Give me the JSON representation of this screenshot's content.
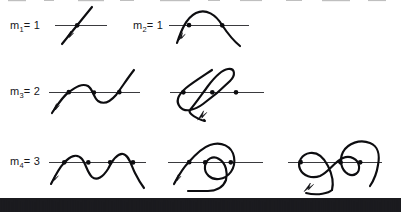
{
  "figure": {
    "background_color": "#ffffff",
    "ink_color": "#0d0d10",
    "axis_color": "#3a3a3e",
    "width": 401,
    "height": 212
  },
  "rows": [
    {
      "label": "m",
      "subscript": "1",
      "equals": "=",
      "value": "1",
      "label_full": "m1 = 1",
      "intersections": 1,
      "panels": [
        {
          "name": "panel-m1-a",
          "intersections": 1,
          "description": "straight diagonal strand crossing a horizontal line once, arrow at lower-left end"
        },
        {
          "name": "panel-m2-a",
          "label": "m",
          "subscript": "2",
          "value": "1",
          "label_full": "m2 = 1",
          "intersections": 2,
          "description": "arch (single hump) crossing a horizontal line twice, arrow at lower-left end"
        }
      ]
    },
    {
      "label": "m",
      "subscript": "3",
      "equals": "=",
      "value": "2",
      "label_full": "m3 = 2",
      "intersections": 3,
      "panels": [
        {
          "name": "panel-m3-a",
          "intersections": 3,
          "description": "S-shaped wave crossing a horizontal line three times, arrow at lower-left end"
        },
        {
          "name": "panel-m3-b",
          "intersections": 3,
          "description": "self-crossing loop (figure-eight style) crossing a horizontal line three times, arrow at lower-left end"
        }
      ]
    },
    {
      "label": "m",
      "subscript": "4",
      "equals": "=",
      "value": "3",
      "label_full": "m4 = 3",
      "intersections": 5,
      "panels": [
        {
          "name": "panel-m4-a",
          "intersections": 4,
          "description": "double-hump wave crossing a horizontal line four times, arrow at lower-left end"
        },
        {
          "name": "panel-m4-b",
          "intersections": 3,
          "description": "spiral curl with inner loop crossing a horizontal line three times, arrow at lower-left end"
        },
        {
          "name": "panel-m4-c",
          "intersections": 3,
          "description": "looping curl crossing a horizontal line three times, arrow at lower-left end"
        }
      ]
    }
  ],
  "labels": {
    "m1": {
      "base": "m",
      "sub": "1",
      "eq": "= 1"
    },
    "m2": {
      "base": "m",
      "sub": "2",
      "eq": "= 1"
    },
    "m3": {
      "base": "m",
      "sub": "3",
      "eq": "= 2"
    },
    "m4": {
      "base": "m",
      "sub": "4",
      "eq": "= 3"
    }
  },
  "artifacts": {
    "bottom_strip": "scanner-noise-bar",
    "bottom_strip_height": 13
  }
}
